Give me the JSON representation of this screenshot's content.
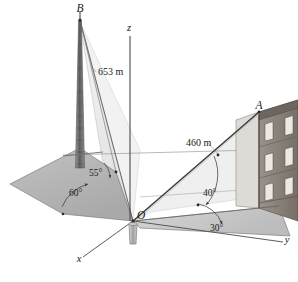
{
  "figure": {
    "background_color": "#ffffff",
    "line_color": "#3c3c3c",
    "points": [
      {
        "id": "B",
        "label": "B",
        "x": 80,
        "y": 12,
        "desc": "top of lattice tower"
      },
      {
        "id": "O",
        "label": "O",
        "x": 133,
        "y": 221,
        "desc": "origin at base"
      },
      {
        "id": "A",
        "label": "A",
        "x": 259,
        "y": 109,
        "desc": "anchor at building corner"
      }
    ],
    "axes": [
      {
        "id": "z",
        "label": "z",
        "x": 129,
        "y": 31,
        "desc": "vertical axis upward"
      },
      {
        "id": "y",
        "label": "y",
        "x": 287,
        "y": 243,
        "desc": "axis to the right"
      },
      {
        "id": "x",
        "label": "x",
        "x": 79,
        "y": 262,
        "desc": "axis toward viewer lower-left"
      }
    ],
    "dimensions": [
      {
        "id": "tower-guy",
        "label": "653 m",
        "x": 98,
        "y": 75,
        "desc": "length of line from B"
      },
      {
        "id": "cable-OA",
        "label": "460 m",
        "x": 186,
        "y": 146,
        "desc": "length of cable O to A"
      }
    ],
    "angles": [
      {
        "id": "angle-55",
        "label": "55°",
        "x": 89,
        "y": 176,
        "desc": "angle at base of tower plane"
      },
      {
        "id": "angle-60",
        "label": "60°",
        "x": 69,
        "y": 196,
        "desc": "angle on ground plane left"
      },
      {
        "id": "angle-40",
        "label": "40°",
        "x": 203,
        "y": 196,
        "desc": "elevation angle of cable OA"
      },
      {
        "id": "angle-30",
        "label": "30°",
        "x": 210,
        "y": 231,
        "desc": "ground plane azimuth angle"
      }
    ],
    "colors": {
      "ground_shade_dark": "#b4b4b4",
      "ground_shade_mid": "#c8c8c8",
      "ground_shade_light": "#e4e4e4",
      "plane_pale": "#f0f0f0",
      "tower": "#6e6e6e",
      "building_brick": "#8a8078",
      "building_side": "#d8d4cf",
      "window": "#ece9e4",
      "stroke": "#3c3c3c"
    },
    "objects": [
      {
        "id": "tower",
        "name": "lattice tower",
        "apex": "B"
      },
      {
        "id": "building",
        "name": "brick building",
        "floors": 3,
        "windows_per_floor": 2
      },
      {
        "id": "marker",
        "name": "base marker post at origin"
      }
    ]
  }
}
